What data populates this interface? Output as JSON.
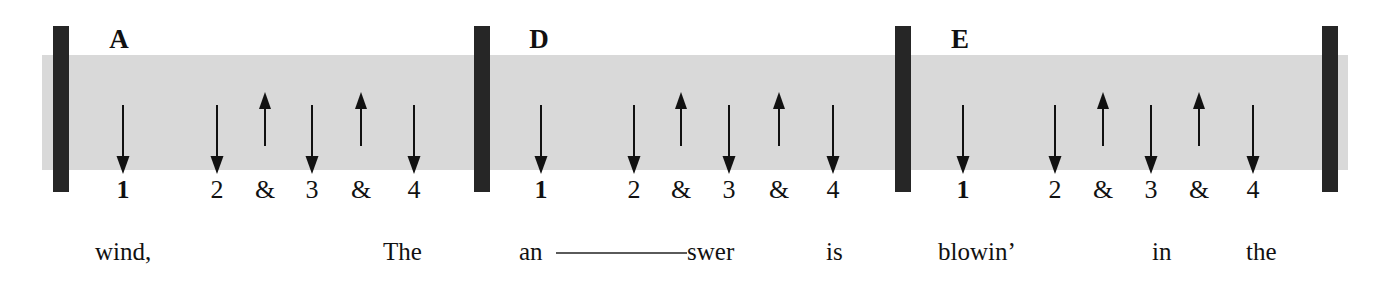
{
  "colors": {
    "band_gray": "#d9d9d9",
    "barline_dark": "#262626",
    "ink": "#111111",
    "melisma_line": "#5a5a5a",
    "background": "#ffffff"
  },
  "band": {
    "x": 42,
    "y": 55,
    "width": 1306,
    "height": 115
  },
  "barlines": [
    {
      "name": "barline-1",
      "x": 53,
      "y": 26,
      "width": 16,
      "height": 166
    },
    {
      "name": "barline-2",
      "x": 474,
      "y": 26,
      "width": 16,
      "height": 166
    },
    {
      "name": "barline-3",
      "x": 895,
      "y": 26,
      "width": 16,
      "height": 166
    },
    {
      "name": "barline-4",
      "x": 1322,
      "y": 26,
      "width": 16,
      "height": 166
    }
  ],
  "measures": [
    {
      "id": "measure-a",
      "chord": "A",
      "chord_x": 119,
      "chord_y": 26,
      "strums": [
        {
          "beat": "1",
          "direction": "down",
          "x": 123
        },
        {
          "beat": "2",
          "direction": "down",
          "x": 217
        },
        {
          "beat": "&",
          "direction": "up",
          "x": 265
        },
        {
          "beat": "3",
          "direction": "down",
          "x": 312
        },
        {
          "beat": "&",
          "direction": "up",
          "x": 361
        },
        {
          "beat": "4",
          "direction": "down",
          "x": 414
        }
      ],
      "beats": [
        {
          "label": "1",
          "x": 123,
          "strong": true
        },
        {
          "label": "2",
          "x": 217,
          "strong": false
        },
        {
          "label": "&",
          "x": 265,
          "strong": false
        },
        {
          "label": "3",
          "x": 312,
          "strong": false
        },
        {
          "label": "&",
          "x": 361,
          "strong": false
        },
        {
          "label": "4",
          "x": 414,
          "strong": false
        }
      ],
      "lyrics": [
        {
          "text": "wind,",
          "x": 95,
          "melisma": null
        },
        {
          "text": "The",
          "x": 383,
          "melisma": null
        }
      ]
    },
    {
      "id": "measure-d",
      "chord": "D",
      "chord_x": 539,
      "chord_y": 26,
      "strums": [
        {
          "beat": "1",
          "direction": "down",
          "x": 541
        },
        {
          "beat": "2",
          "direction": "down",
          "x": 634
        },
        {
          "beat": "&",
          "direction": "up",
          "x": 681
        },
        {
          "beat": "3",
          "direction": "down",
          "x": 729
        },
        {
          "beat": "&",
          "direction": "up",
          "x": 779
        },
        {
          "beat": "4",
          "direction": "down",
          "x": 833
        }
      ],
      "beats": [
        {
          "label": "1",
          "x": 541,
          "strong": true
        },
        {
          "label": "2",
          "x": 634,
          "strong": false
        },
        {
          "label": "&",
          "x": 681,
          "strong": false
        },
        {
          "label": "3",
          "x": 729,
          "strong": false
        },
        {
          "label": "&",
          "x": 779,
          "strong": false
        },
        {
          "label": "4",
          "x": 833,
          "strong": false
        }
      ],
      "lyrics": [
        {
          "text": "an",
          "x": 519,
          "melisma": {
            "x": 556,
            "width": 131,
            "y": 252
          }
        },
        {
          "text": "swer",
          "x": 687,
          "melisma": null
        },
        {
          "text": "is",
          "x": 826,
          "melisma": null
        }
      ]
    },
    {
      "id": "measure-e",
      "chord": "E",
      "chord_x": 960,
      "chord_y": 26,
      "strums": [
        {
          "beat": "1",
          "direction": "down",
          "x": 963
        },
        {
          "beat": "2",
          "direction": "down",
          "x": 1055
        },
        {
          "beat": "&",
          "direction": "up",
          "x": 1103
        },
        {
          "beat": "3",
          "direction": "down",
          "x": 1151
        },
        {
          "beat": "&",
          "direction": "up",
          "x": 1199
        },
        {
          "beat": "4",
          "direction": "down",
          "x": 1253
        }
      ],
      "beats": [
        {
          "label": "1",
          "x": 963,
          "strong": true
        },
        {
          "label": "2",
          "x": 1055,
          "strong": false
        },
        {
          "label": "&",
          "x": 1103,
          "strong": false
        },
        {
          "label": "3",
          "x": 1151,
          "strong": false
        },
        {
          "label": "&",
          "x": 1199,
          "strong": false
        },
        {
          "label": "4",
          "x": 1253,
          "strong": false
        }
      ],
      "lyrics": [
        {
          "text": "blowin’",
          "x": 938,
          "melisma": null
        },
        {
          "text": "in",
          "x": 1152,
          "melisma": null
        },
        {
          "text": "the",
          "x": 1246,
          "melisma": null
        }
      ]
    }
  ],
  "geometry": {
    "down_arrow": {
      "top": 105,
      "bottom": 174,
      "shaft_width": 2,
      "head_width": 13,
      "head_height": 18
    },
    "up_arrow": {
      "top": 92,
      "bottom": 146,
      "shaft_width": 2,
      "head_width": 12,
      "head_height": 17
    },
    "beat_row_y": 177,
    "lyric_row_y": 239
  }
}
